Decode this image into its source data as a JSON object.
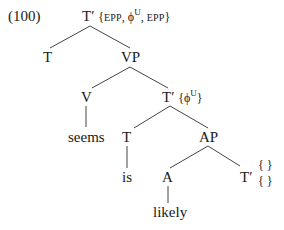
{
  "example_number": "(100)",
  "nodes": {
    "root": {
      "label": "T′",
      "features_open": "{",
      "f1": "EPP",
      "sep1": ", ",
      "f2": "ϕ",
      "f2_sup": "U",
      "sep2": ", ",
      "f3": "EPP",
      "features_close": "}"
    },
    "t_left": {
      "label": "T"
    },
    "vp": {
      "label": "VP"
    },
    "v": {
      "label": "V"
    },
    "seems": {
      "label": "seems"
    },
    "t_bar_mid": {
      "label": "T′",
      "features_open": "{",
      "f1": "ϕ",
      "f1_sup": "U",
      "features_close": "}"
    },
    "t_mid": {
      "label": "T"
    },
    "is": {
      "label": "is"
    },
    "ap": {
      "label": "AP"
    },
    "a": {
      "label": "A"
    },
    "likely": {
      "label": "likely"
    },
    "t_bar_low": {
      "label": "T′",
      "brace_top": "{ }",
      "brace_bottom": "{ }"
    }
  }
}
